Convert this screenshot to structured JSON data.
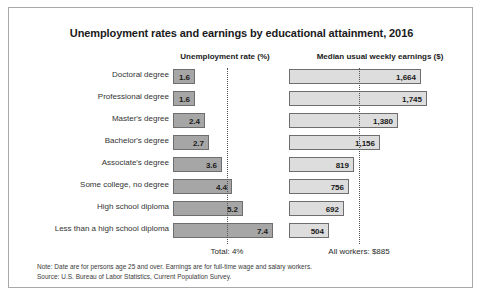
{
  "chart_data": {
    "type": "bar",
    "title": "Unemployment rates and earnings by educational attainment, 2016",
    "orientation": "horizontal",
    "grid": false,
    "legend_position": "none",
    "categories": [
      "Doctoral degree",
      "Professional degree",
      "Master's degree",
      "Bachelor's degree",
      "Associate's degree",
      "Some college, no degree",
      "High school diploma",
      "Less than a high school diploma"
    ],
    "panels": [
      {
        "label": "Unemployment rate (%)",
        "xlabel": "Unemployment rate (%)",
        "unit": "%",
        "values": [
          1.6,
          1.6,
          2.4,
          2.7,
          3.6,
          4.4,
          5.2,
          7.4
        ],
        "value_labels": [
          "1.6",
          "1.6",
          "2.4",
          "2.7",
          "3.6",
          "4.4",
          "5.2",
          "7.4"
        ],
        "reference_line": {
          "value": 4,
          "label": "Total: 4%"
        },
        "xlim": [
          0,
          7.4
        ],
        "bar_color": "#a6a6a6",
        "bar_border": "#6e6e6e"
      },
      {
        "label": "Median usual weekly earnings ($)",
        "xlabel": "Median usual weekly earnings ($)",
        "unit": "$",
        "values": [
          1664,
          1745,
          1380,
          1156,
          819,
          756,
          692,
          504
        ],
        "value_labels": [
          "1,664",
          "1,745",
          "1,380",
          "1,156",
          "819",
          "756",
          "692",
          "504"
        ],
        "reference_line": {
          "value": 885,
          "label": "All workers: $885"
        },
        "xlim": [
          0,
          1745
        ],
        "bar_color": "#dddddd",
        "bar_border": "#6e6e6e"
      }
    ],
    "notes": [
      "Note: Date are for persons age 25 and over. Earnings are for full-time wage and salary workers.",
      "Source: U.S. Bureau of Labor Statistics, Current Population Survey."
    ]
  },
  "header": {
    "title": "Unemployment rates and earnings by educational attainment, 2016",
    "col_unemployment": "Unemployment rate (%)",
    "col_earnings": "Median usual weekly earnings ($)"
  },
  "footer": {
    "total_unemployment": "Total: 4%",
    "all_workers_earnings": "All workers: $885",
    "note": "Note: Date are for persons age 25 and over. Earnings are for full-time wage and salary workers.",
    "source": "Source: U.S. Bureau of Labor Statistics, Current Population Survey."
  }
}
